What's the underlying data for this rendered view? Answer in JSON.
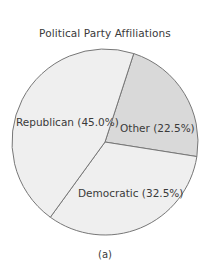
{
  "chart_data": {
    "type": "pie",
    "title": "Political Party Affiliations",
    "caption": "(a)",
    "categories": [
      "Republican",
      "Other",
      "Democratic"
    ],
    "values": [
      45.0,
      22.5,
      32.5
    ],
    "unit": "%",
    "labels": [
      "Republican (45.0%)",
      "Other (22.5%)",
      "Democratic (32.5%)"
    ],
    "colors": [
      "#efefef",
      "#d9d9d9",
      "#efefef"
    ],
    "stroke_color": "#777777",
    "start_angle_deg": -72,
    "legend": "none (inline labels)"
  }
}
